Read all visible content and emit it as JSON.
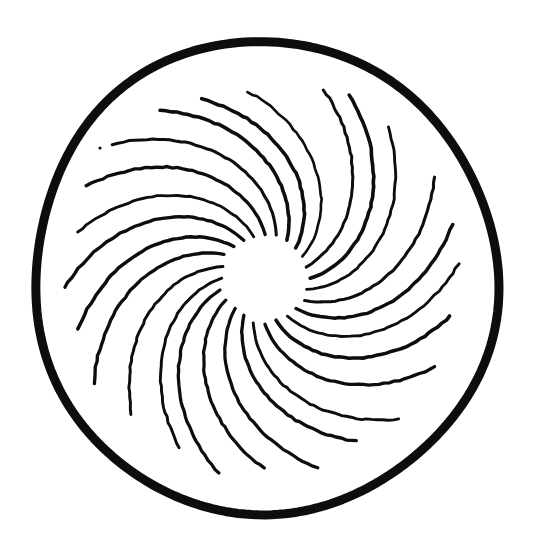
{
  "figure": {
    "background_color": "#ffffff",
    "ink_color": "#0d0d0d",
    "canvas": {
      "width": 541,
      "height": 549
    }
  },
  "chart_data": {
    "type": "scatter",
    "xlabel": "",
    "ylabel": "",
    "center": {
      "x": 265,
      "y": 278
    },
    "outer_circle": {
      "label": "outer ring",
      "radius_x": 232,
      "radius_y": 236,
      "stroke_width": 9,
      "color": "#0d0d0d"
    },
    "hub": {
      "label": "blank hub",
      "radius": 42
    },
    "spiral": {
      "label": "spiral arms",
      "arm_count": 24,
      "inner_radius": 44,
      "outer_radius": 196,
      "sweep_degrees": 62,
      "direction": "counterclockwise-outward",
      "stroke_width": 3,
      "color": "#0d0d0d"
    },
    "speck": {
      "label": "ink speck",
      "x": 100,
      "y": 148,
      "radius": 1.6
    }
  }
}
